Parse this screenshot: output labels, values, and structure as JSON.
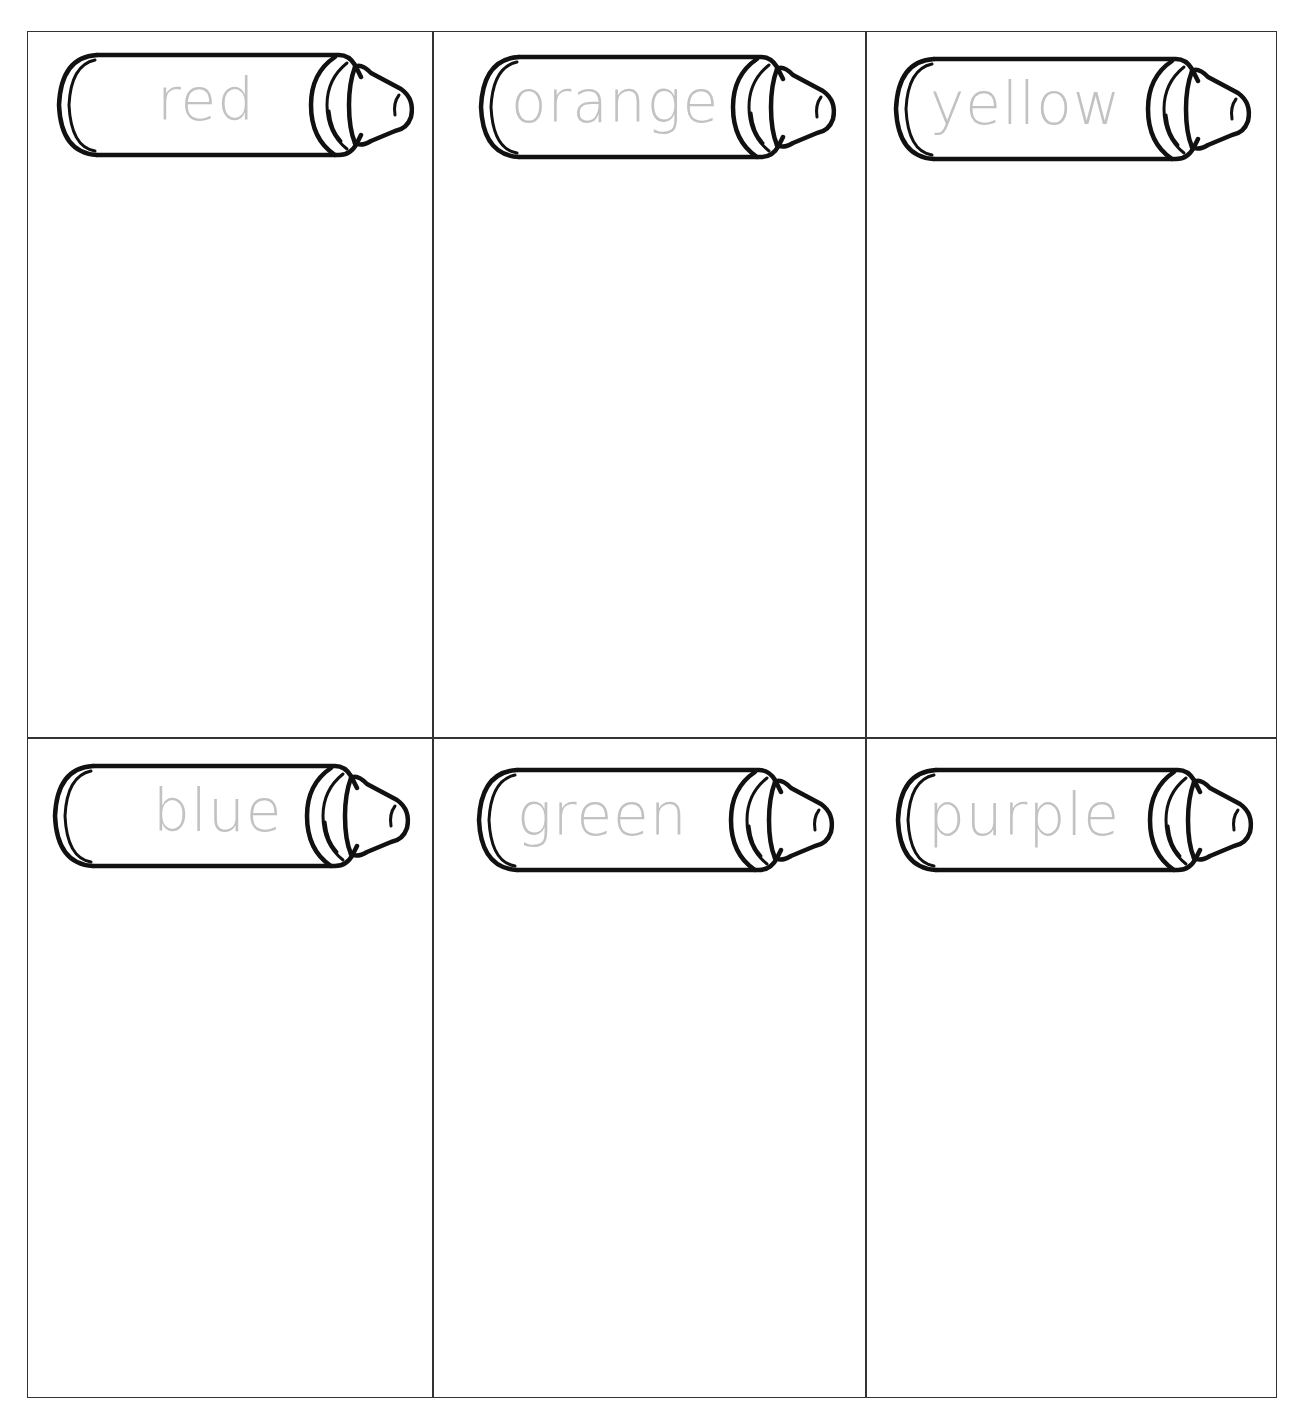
{
  "worksheet": {
    "line_color": "#333333",
    "trace_text_color": "#c2c2c2",
    "cells": [
      {
        "label": "red"
      },
      {
        "label": "orange"
      },
      {
        "label": "yellow"
      },
      {
        "label": "blue"
      },
      {
        "label": "green"
      },
      {
        "label": "purple"
      }
    ]
  }
}
